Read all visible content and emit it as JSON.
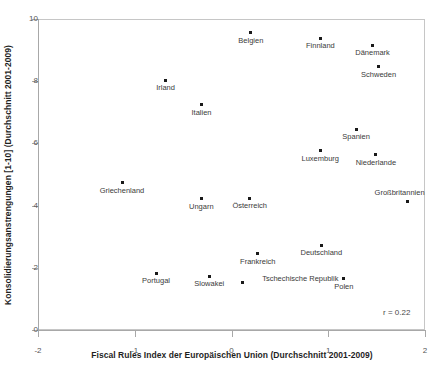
{
  "figure": {
    "title_remnant": "",
    "width": 438,
    "height": 367,
    "background": "#ffffff",
    "frame_color": "#c6c6c6",
    "marker_color": "#1a1a1a",
    "label_color": "#3a3a3a"
  },
  "chart_data": {
    "type": "scatter",
    "title": "",
    "xlabel": "Fiscal Rules Index der Europäischen Union (Durchschnitt 2001-2009)",
    "ylabel": "Konsolidierungsanstrengungen [1-10] (Durchschnitt 2001-2009)",
    "xlim": [
      -2,
      2
    ],
    "ylim": [
      0,
      10
    ],
    "xticks": [
      -2,
      -1,
      0,
      1,
      2
    ],
    "xtick_labels": [
      "-2",
      "-1",
      "0",
      "1",
      "2"
    ],
    "yticks": [
      0,
      2,
      4,
      6,
      8,
      10
    ],
    "ytick_labels": [
      "0",
      "2",
      "4",
      "6",
      "8",
      "10"
    ],
    "grid": false,
    "legend": false,
    "annotation": "r = 0.22",
    "points": [
      {
        "label": "Belgien",
        "x": 0.2,
        "y": 9.55,
        "label_dx": 0,
        "label_dy": 8
      },
      {
        "label": "Finnland",
        "x": 0.92,
        "y": 9.38,
        "label_dx": 0,
        "label_dy": 8
      },
      {
        "label": "Dänemark",
        "x": 1.46,
        "y": 9.15,
        "label_dx": 0,
        "label_dy": 8
      },
      {
        "label": "Schweden",
        "x": 1.52,
        "y": 8.47,
        "label_dx": 0,
        "label_dy": 8
      },
      {
        "label": "Irland",
        "x": -0.68,
        "y": 8.03,
        "label_dx": 0,
        "label_dy": 8
      },
      {
        "label": "Italien",
        "x": -0.31,
        "y": 7.24,
        "label_dx": 0,
        "label_dy": 8
      },
      {
        "label": "Spanien",
        "x": 1.29,
        "y": 6.45,
        "label_dx": 0,
        "label_dy": 8
      },
      {
        "label": "Luxemburg",
        "x": 0.92,
        "y": 5.76,
        "label_dx": 0,
        "label_dy": 8
      },
      {
        "label": "Niederlande",
        "x": 1.49,
        "y": 5.64,
        "label_dx": 0,
        "label_dy": 8
      },
      {
        "label": "Griechenland",
        "x": -1.13,
        "y": 4.74,
        "label_dx": 0,
        "label_dy": 8
      },
      {
        "label": "Ungarn",
        "x": -0.31,
        "y": 4.22,
        "label_dx": 0,
        "label_dy": 8
      },
      {
        "label": "Österreich",
        "x": 0.19,
        "y": 4.23,
        "label_dx": 0,
        "label_dy": 8
      },
      {
        "label": "Großbritannien",
        "x": 1.82,
        "y": 4.13,
        "label_dx": -8,
        "label_dy": -9
      },
      {
        "label": "Deutschland",
        "x": 0.93,
        "y": 2.73,
        "label_dx": 0,
        "label_dy": 8
      },
      {
        "label": "Frankreich",
        "x": 0.27,
        "y": 2.45,
        "label_dx": 0,
        "label_dy": 8
      },
      {
        "label": "Portugal",
        "x": -0.78,
        "y": 1.83,
        "label_dx": 0,
        "label_dy": 8
      },
      {
        "label": "Slowakei",
        "x": -0.23,
        "y": 1.73,
        "label_dx": 0,
        "label_dy": 8
      },
      {
        "label": "Polen",
        "x": 1.16,
        "y": 1.65,
        "label_dx": 0,
        "label_dy": 8
      },
      {
        "label": "Tschechische Republik",
        "x": 0.11,
        "y": 1.54,
        "label_dx": 58,
        "label_dy": -3
      }
    ]
  }
}
